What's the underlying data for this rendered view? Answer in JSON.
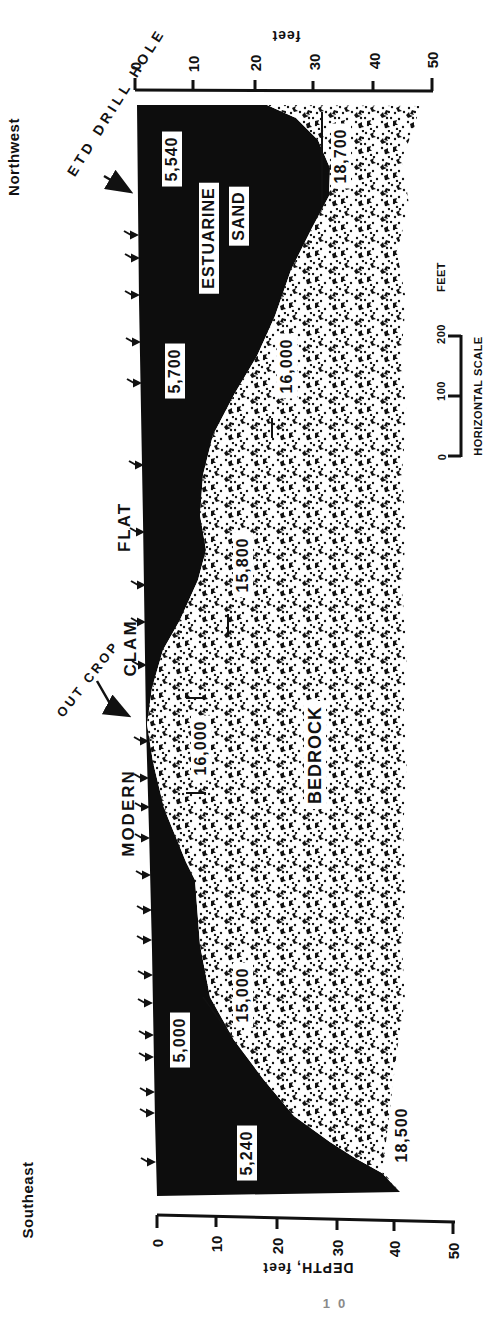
{
  "figure": {
    "type": "geologic-cross-section",
    "ends": {
      "northwest": "Northwest",
      "southeast": "Southeast"
    },
    "drill_hole_label": "ETD DRILL HOLE",
    "outcrop_label": "OUT CROP",
    "surface_labels": {
      "flat": "FLAT",
      "clam": "CLAM",
      "modern": "MODERN"
    },
    "units": {
      "estuarine_line1": "ESTUARINE",
      "estuarine_line2": "SAND",
      "bedrock": "BEDROCK"
    },
    "dates": {
      "d5540": "5,540",
      "d18700": "18,700",
      "d5700": "5,700",
      "d16000_upper": "16,000",
      "d15800": "15,800",
      "d16000_lower": "16,000",
      "d15000": "15,000",
      "d5000": "5,000",
      "d5240": "5,240",
      "d18500": "18,500"
    },
    "axes": {
      "top": {
        "label": "feet",
        "ticks": [
          "0",
          "10",
          "20",
          "30",
          "40",
          "50"
        ]
      },
      "bottom": {
        "label": "DEPTH, feet",
        "ticks": [
          "0",
          "10",
          "20",
          "30",
          "40",
          "50"
        ]
      }
    },
    "scalebar": {
      "title": "HORIZONTAL SCALE",
      "t0": "0",
      "t100": "100",
      "t200": "200",
      "unit": "FEET"
    },
    "page_number": "10",
    "colors": {
      "ink": "#111111",
      "paper": "#ffffff"
    }
  }
}
